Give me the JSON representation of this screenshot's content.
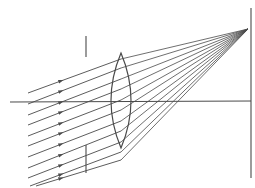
{
  "diagram": {
    "title": "Oblique parallel rays focused by a converging lens onto a screen",
    "colors": {
      "ink": "#4a4a4a",
      "background": "#ffffff"
    },
    "optical_axis": {
      "x1": 10,
      "y1": 102,
      "x2": 251,
      "y2": 101
    },
    "aperture_stop": {
      "x": 86,
      "top_segment": [
        36,
        57
      ],
      "bottom_segment": [
        145,
        173
      ]
    },
    "lens": {
      "type": "biconvex",
      "cx": 121,
      "top": 53,
      "bottom": 148,
      "half_width": 10
    },
    "screen": {
      "x": 251,
      "y1": 8,
      "y2": 178
    },
    "focal_point": {
      "x": 248,
      "y": 29
    },
    "incident_rays": {
      "count": 11,
      "slope": -0.55,
      "arrow_x": 61,
      "direction": "toward-lens",
      "rays": [
        {
          "x0": 28,
          "y0": 93,
          "lens_y": 59
        },
        {
          "x0": 28,
          "y0": 104,
          "lens_y": 68
        },
        {
          "x0": 28,
          "y0": 115,
          "lens_y": 79
        },
        {
          "x0": 28,
          "y0": 125,
          "lens_y": 89
        },
        {
          "x0": 28,
          "y0": 136,
          "lens_y": 100
        },
        {
          "x0": 28,
          "y0": 146,
          "lens_y": 110
        },
        {
          "x0": 28,
          "y0": 157,
          "lens_y": 121
        },
        {
          "x0": 28,
          "y0": 168,
          "lens_y": 131
        },
        {
          "x0": 28,
          "y0": 178,
          "lens_y": 142
        },
        {
          "x0": 30,
          "y0": 186,
          "lens_y": 152
        },
        {
          "x0": 36,
          "y0": 186,
          "lens_y": 160
        }
      ]
    }
  }
}
